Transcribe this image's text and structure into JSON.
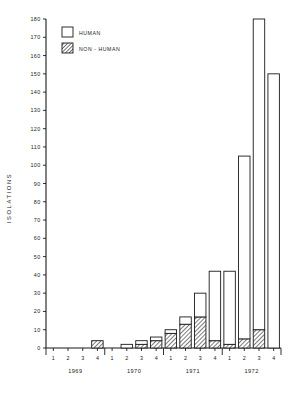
{
  "chart_data": {
    "type": "bar",
    "title": "",
    "subtitle": "",
    "xlabel": "",
    "ylabel": "ISOLATIONS",
    "ylim": [
      0,
      180
    ],
    "ytick_step": 10,
    "yticks": [
      0,
      10,
      20,
      30,
      40,
      50,
      60,
      70,
      80,
      90,
      100,
      110,
      120,
      130,
      140,
      150,
      160,
      170,
      180
    ],
    "grid": false,
    "stacked": true,
    "legend_position": "top-left",
    "categories": [
      "1",
      "2",
      "3",
      "4",
      "1",
      "2",
      "3",
      "4",
      "1",
      "2",
      "3",
      "4",
      "1",
      "2",
      "3",
      "4"
    ],
    "group_labels": [
      "1969",
      "1970",
      "1971",
      "1972"
    ],
    "quarter_labels": [
      "1",
      "2",
      "3",
      "4"
    ],
    "series": [
      {
        "name": "NON-HUMAN",
        "values": [
          0,
          0,
          0,
          4,
          0,
          0,
          2,
          4,
          8,
          13,
          17,
          4,
          2,
          5,
          10,
          0
        ]
      },
      {
        "name": "HUMAN",
        "values": [
          0,
          0,
          0,
          0,
          0,
          2,
          2,
          2,
          2,
          4,
          13,
          38,
          40,
          100,
          170,
          150
        ]
      }
    ],
    "totals": [
      0,
      0,
      0,
      4,
      0,
      2,
      4,
      6,
      10,
      17,
      30,
      42,
      42,
      105,
      180,
      150
    ],
    "colors": {
      "human": "#ffffff",
      "non_human_hatch": "#1a1a1a",
      "axis": "#1a1a1a",
      "background": "#ffffff"
    }
  },
  "legend": {
    "items": [
      {
        "label": "HUMAN",
        "style": "empty"
      },
      {
        "label": "NON - HUMAN",
        "style": "hatched"
      }
    ]
  },
  "axes": {
    "y_title": "ISOLATIONS"
  }
}
